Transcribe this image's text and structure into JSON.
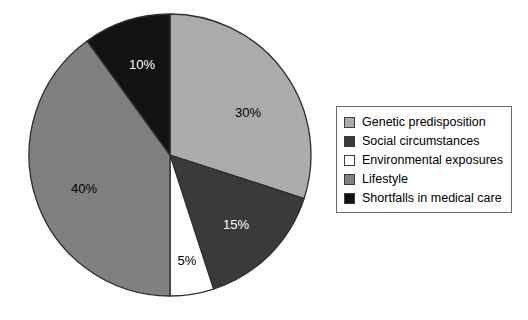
{
  "chart_data": {
    "type": "pie",
    "title": "",
    "subtitle": "",
    "xlabel": "",
    "ylabel": "",
    "grid": false,
    "legend_position": "right",
    "start_angle_deg": 0,
    "direction": "clockwise",
    "categories": [
      "Genetic predisposition",
      "Social circumstances",
      "Environmental exposures",
      "Lifestyle",
      "Shortfalls in medical care"
    ],
    "values": [
      30,
      15,
      5,
      40,
      10
    ],
    "value_labels": [
      "30%",
      "15%",
      "5%",
      "40%",
      "10%"
    ],
    "colors": [
      "#ababab",
      "#3a3a3a",
      "#ffffff",
      "#808080",
      "#121212"
    ],
    "label_text_colors": [
      "#000000",
      "#ffffff",
      "#000000",
      "#000000",
      "#ffffff"
    ],
    "slices": [
      {
        "name": "Genetic predisposition",
        "value": 30,
        "label": "30%",
        "color": "#ababab",
        "label_color": "#000000",
        "start_deg": 0,
        "end_deg": 108,
        "label_x": 248,
        "label_y": 117
      },
      {
        "name": "Social circumstances",
        "value": 15,
        "label": "15%",
        "color": "#3a3a3a",
        "label_color": "#ffffff",
        "start_deg": 108,
        "end_deg": 162,
        "label_x": 236,
        "label_y": 229
      },
      {
        "name": "Environmental exposures",
        "value": 5,
        "label": "5%",
        "color": "#ffffff",
        "label_color": "#000000",
        "start_deg": 162,
        "end_deg": 180,
        "label_x": 187,
        "label_y": 265
      },
      {
        "name": "Lifestyle",
        "value": 40,
        "label": "40%",
        "color": "#808080",
        "label_color": "#000000",
        "start_deg": 180,
        "end_deg": 324,
        "label_x": 84,
        "label_y": 193
      },
      {
        "name": "Shortfalls in medical care",
        "value": 10,
        "label": "10%",
        "color": "#121212",
        "label_color": "#ffffff",
        "start_deg": 324,
        "end_deg": 360,
        "label_x": 142,
        "label_y": 69
      }
    ],
    "geometry": {
      "center_x": 170,
      "center_y": 155,
      "radius": 141,
      "outline_color": "#2e2e2e"
    }
  },
  "legend": {
    "border_color": "#6b6b6b",
    "items": [
      {
        "label": "Genetic predisposition",
        "color": "#ababab"
      },
      {
        "label": "Social circumstances",
        "color": "#3a3a3a"
      },
      {
        "label": "Environmental exposures",
        "color": "#ffffff"
      },
      {
        "label": "Lifestyle",
        "color": "#808080"
      },
      {
        "label": "Shortfalls in medical care",
        "color": "#121212"
      }
    ]
  }
}
